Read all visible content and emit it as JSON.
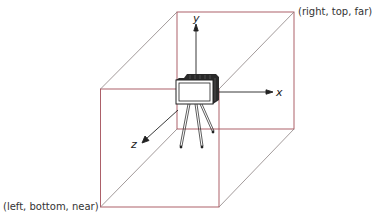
{
  "diagram": {
    "title": "",
    "corner_labels": {
      "far_top_right": "(right, top, far)",
      "near_bottom_left": "(left, bottom, near)"
    },
    "axes": {
      "x": "x",
      "y": "y",
      "z": "z"
    },
    "colors": {
      "box_edge": "#a4505a",
      "diagonal_edge": "#8c8c8c",
      "camera": "#222222",
      "axis": "#222222"
    },
    "objects": [
      "viewing-volume-box",
      "camera-on-tripod",
      "coordinate-axes"
    ]
  }
}
